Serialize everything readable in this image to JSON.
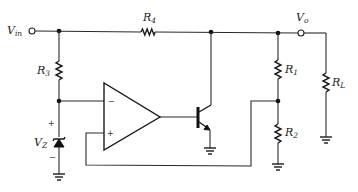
{
  "diagram": {
    "type": "circuit-schematic",
    "terminals": {
      "input": {
        "main": "V",
        "sub": "in"
      },
      "output": {
        "main": "V",
        "sub": "o"
      }
    },
    "resistors": {
      "r1": {
        "main": "R",
        "sub": "1"
      },
      "r2": {
        "main": "R",
        "sub": "2"
      },
      "r3": {
        "main": "R",
        "sub": "3"
      },
      "r4": {
        "main": "R",
        "sub": "4"
      },
      "rl": {
        "main": "R",
        "sub": "L"
      }
    },
    "zener": {
      "main": "V",
      "sub": "Z",
      "plus": "+",
      "minus": "−"
    },
    "opamp": {
      "inverting_sign": "−",
      "noninverting_sign": "+"
    },
    "components": [
      "V_in terminal",
      "R4",
      "R3",
      "Zener diode V_Z",
      "Op-amp",
      "NPN transistor",
      "R1",
      "R2",
      "R_L",
      "V_o terminal",
      "Ground symbols x4"
    ]
  }
}
